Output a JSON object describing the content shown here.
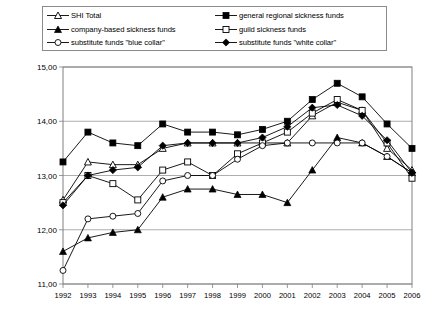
{
  "legend": {
    "position": "top",
    "columns": [
      {
        "items": [
          {
            "label": "SHI Total",
            "marker": "open-triangle",
            "series_key": "shi_total"
          },
          {
            "label": "company-based sickness funds",
            "marker": "filled-triangle",
            "series_key": "company_based"
          },
          {
            "label": "substitute funds \"blue collar\"",
            "marker": "open-circle",
            "series_key": "substitute_blue"
          }
        ]
      },
      {
        "items": [
          {
            "label": "general regional sickness funds",
            "marker": "filled-square",
            "series_key": "general_regional"
          },
          {
            "label": "guild sickness funds",
            "marker": "open-square",
            "series_key": "guild"
          },
          {
            "label": "substitute funds \"white collar\"",
            "marker": "filled-diamond",
            "series_key": "substitute_white"
          }
        ]
      }
    ]
  },
  "chart_data": {
    "type": "line",
    "title": "",
    "subtitle": "",
    "xlabel": "",
    "ylabel": "",
    "grid": true,
    "legend_position": "top",
    "xlim": [
      1992,
      2006
    ],
    "ylim": [
      11.0,
      15.0
    ],
    "ytick_step": 1.0,
    "ytick_labels": [
      "11,00",
      "12,00",
      "13,00",
      "14,00",
      "15,00"
    ],
    "ytick_values": [
      11.0,
      12.0,
      13.0,
      14.0,
      15.0
    ],
    "categories": [
      1992,
      1993,
      1994,
      1995,
      1996,
      1997,
      1998,
      1999,
      2000,
      2001,
      2002,
      2003,
      2004,
      2005,
      2006
    ],
    "xtick_labels": [
      "1992",
      "1993",
      "1994",
      "1995",
      "1996",
      "1997",
      "1998",
      "1999",
      "2000",
      "2001",
      "2002",
      "2003",
      "2004",
      "2005",
      "2006"
    ],
    "series": [
      {
        "name": "SHI Total",
        "key": "shi_total",
        "marker": "open-triangle",
        "color": "#000000",
        "values": [
          12.55,
          13.25,
          13.2,
          13.2,
          13.5,
          13.6,
          13.6,
          13.6,
          13.6,
          13.6,
          14.1,
          14.35,
          14.2,
          13.5,
          13.1
        ]
      },
      {
        "name": "general regional sickness funds",
        "key": "general_regional",
        "marker": "filled-square",
        "color": "#000000",
        "values": [
          13.25,
          13.8,
          13.6,
          13.55,
          13.95,
          13.8,
          13.8,
          13.75,
          13.85,
          14.0,
          14.4,
          14.7,
          14.45,
          13.95,
          13.5
        ]
      },
      {
        "name": "company-based sickness funds",
        "key": "company_based",
        "marker": "filled-triangle",
        "color": "#000000",
        "values": [
          11.6,
          11.85,
          11.95,
          12.0,
          12.6,
          12.75,
          12.75,
          12.65,
          12.65,
          12.5,
          13.1,
          13.7,
          13.6,
          13.35,
          13.05
        ]
      },
      {
        "name": "guild sickness funds",
        "key": "guild",
        "marker": "open-square",
        "color": "#000000",
        "values": [
          12.5,
          13.0,
          12.85,
          12.55,
          13.1,
          13.25,
          13.0,
          13.4,
          13.6,
          13.8,
          14.15,
          14.4,
          14.2,
          13.6,
          12.95
        ]
      },
      {
        "name": "substitute funds \"blue collar\"",
        "key": "substitute_blue",
        "marker": "open-circle",
        "color": "#000000",
        "values": [
          11.25,
          12.2,
          12.25,
          12.3,
          12.9,
          13.0,
          13.0,
          13.3,
          13.55,
          13.6,
          13.6,
          13.6,
          13.6,
          13.35,
          13.05
        ]
      },
      {
        "name": "substitute funds \"white collar\"",
        "key": "substitute_white",
        "marker": "filled-diamond",
        "color": "#000000",
        "values": [
          12.45,
          13.0,
          13.1,
          13.15,
          13.55,
          13.6,
          13.6,
          13.6,
          13.7,
          13.9,
          14.25,
          14.3,
          14.1,
          13.65,
          13.05
        ]
      }
    ]
  },
  "colors": {
    "line": "#000000",
    "grid": "#999999",
    "axis": "#808080",
    "background": "#ffffff"
  }
}
